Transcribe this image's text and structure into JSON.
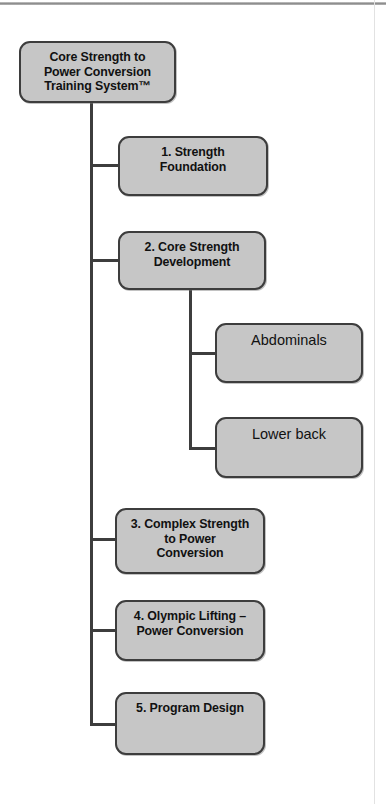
{
  "document": {
    "type": "hierarchy-diagram",
    "title": "Core Strength to Power Conversion Training System™"
  },
  "nodes": {
    "root": {
      "label": "Core Strength to\nPower Conversion\nTraining System™",
      "style": "bold",
      "level": 0
    },
    "level1": [
      {
        "label": "1. Strength\nFoundation",
        "style": "bold",
        "level": 1
      },
      {
        "label": "2. Core Strength\nDevelopment",
        "style": "bold",
        "level": 1
      },
      {
        "label": "3. Complex Strength\nto Power\nConversion",
        "style": "bold",
        "level": 1
      },
      {
        "label": "4. Olympic Lifting –\nPower Conversion",
        "style": "bold",
        "level": 1
      },
      {
        "label": "5. Program Design",
        "style": "bold",
        "level": 1
      }
    ],
    "level2": [
      {
        "label": "Abdominals",
        "style": "plain",
        "level": 2,
        "parent": "2. Core Strength Development"
      },
      {
        "label": "Lower back",
        "style": "plain",
        "level": 2,
        "parent": "2. Core Strength Development"
      }
    ]
  },
  "colors": {
    "node_fill": "#c6c6c6",
    "node_border": "#3d3d3d",
    "connector": "#3d3d3d",
    "page_background": "#ffffff",
    "text": "#111111"
  }
}
